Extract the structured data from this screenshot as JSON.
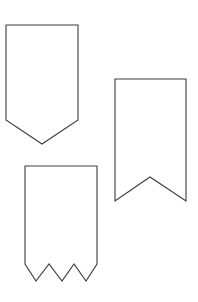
{
  "page": {
    "background_color": "#ffffff",
    "width": 198,
    "height": 302
  },
  "style": {
    "stroke_color": "#3c3c3c",
    "fill_color": "#ffffff",
    "stroke_width": 1.1
  },
  "shapes": [
    {
      "id": "shape-pointed-pennant",
      "name": "Pointed Pennant Banner",
      "description": "Rectangular banner with a single downward V point at the bottom",
      "points": "6,25 78,25 78,120 42,144 6,120",
      "bounds": {
        "x": 6,
        "y": 25,
        "width": 72,
        "height": 119
      }
    },
    {
      "id": "shape-swallowtail-pennant",
      "name": "Swallowtail Banner",
      "description": "Rectangular banner with a notched swallowtail cut at the bottom",
      "points": "115,79 186,79 186,201 150,177 115,201",
      "bounds": {
        "x": 115,
        "y": 79,
        "width": 71,
        "height": 122
      }
    },
    {
      "id": "shape-zigzag-pennant",
      "name": "Zigzag Fringe Banner",
      "description": "Rectangular banner with a three-point zigzag fringe along the bottom edge",
      "points": "25,166 97,166 97,264 86,281 74,264 62,281 49,264 36,281 25,264",
      "bounds": {
        "x": 25,
        "y": 166,
        "width": 72,
        "height": 115
      }
    }
  ]
}
